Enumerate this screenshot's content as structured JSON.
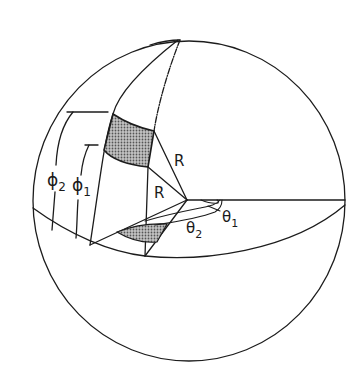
{
  "figure": {
    "type": "spherical-coordinate-diagram",
    "colors": {
      "line": "#1c1c1c",
      "shading": "#9a9a9a",
      "background": "#ffffff"
    }
  },
  "labels": {
    "radius_upper": "R",
    "radius_lower": "R",
    "phi_2": {
      "symbol": "ϕ",
      "subscript": "2"
    },
    "phi_1": {
      "symbol": "ϕ",
      "subscript": "1"
    },
    "theta_1": {
      "symbol": "θ",
      "subscript": "1"
    },
    "theta_2": {
      "symbol": "θ",
      "subscript": "2"
    }
  }
}
